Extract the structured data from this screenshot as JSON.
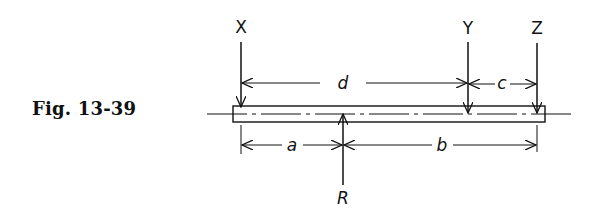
{
  "figure": {
    "caption": "Fig. 13-39",
    "forces": [
      {
        "label": "X",
        "direction": "down"
      },
      {
        "label": "Y",
        "direction": "down"
      },
      {
        "label": "Z",
        "direction": "down"
      },
      {
        "label": "R",
        "direction": "up"
      }
    ],
    "dimensions": {
      "top": [
        {
          "label": "d",
          "from": "X",
          "to": "Y"
        },
        {
          "label": "c",
          "from": "Y",
          "to": "Z"
        }
      ],
      "bottom": [
        {
          "label": "a",
          "from": "X",
          "to": "R"
        },
        {
          "label": "b",
          "from": "R",
          "to": "Z"
        }
      ]
    },
    "colors": {
      "ink": "#111111",
      "background": "#ffffff"
    }
  }
}
